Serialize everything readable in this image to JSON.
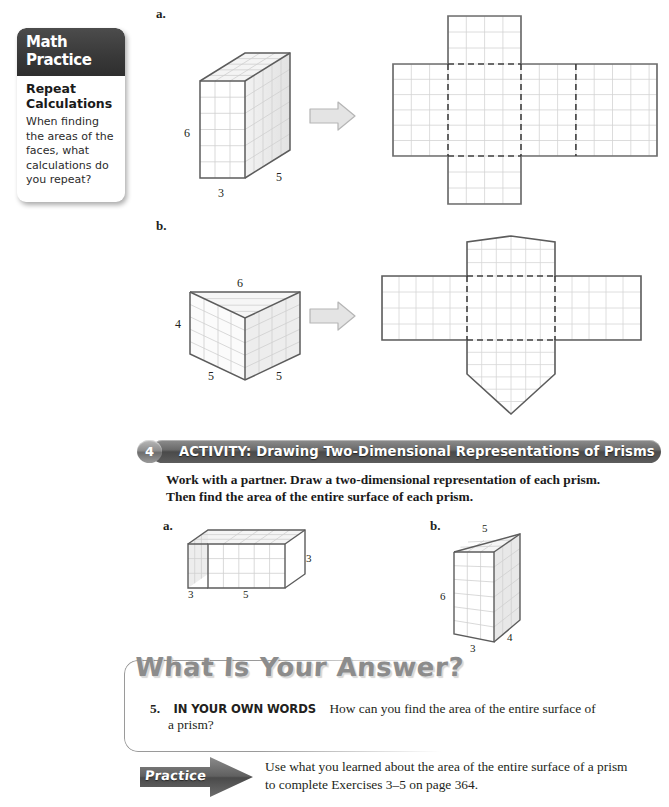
{
  "callout": {
    "header_line1": "Math",
    "header_line2": "Practice",
    "title_line1": "Repeat",
    "title_line2": "Calculations",
    "body": "When finding the areas of the faces, what calculations do you repeat?"
  },
  "top_examples": {
    "a_label": "a.",
    "b_label": "b.",
    "rect_prism": {
      "width_label": "3",
      "depth_label": "5",
      "height_label": "6"
    },
    "tri_prism": {
      "top_label": "6",
      "height_label": "4",
      "left_slant_label": "5",
      "right_slant_label": "5"
    }
  },
  "activity": {
    "number": "4",
    "title": "ACTIVITY:  Drawing Two-Dimensional Representations of Prisms",
    "instructions_line1": "Work with a partner. Draw a two-dimensional representation of each prism.",
    "instructions_line2": "Then find the area of the entire surface of each prism.",
    "a_label": "a.",
    "b_label": "b.",
    "figure_a": {
      "depth_label": "3",
      "width_label": "5",
      "height_label": "3"
    },
    "figure_b": {
      "top_label": "5",
      "height_label": "6",
      "front_label": "3",
      "side_label": "4"
    }
  },
  "answer_section": {
    "heading": "What Is Your Answer?",
    "question_number": "5.",
    "question_caps": "IN YOUR OWN WORDS",
    "question_text": "How can you find the area of the entire surface of",
    "question_text_line2": "a prism?"
  },
  "practice": {
    "label": "Practice",
    "text_line1": "Use what you learned about the area of the entire surface of a prism",
    "text_line2": "to complete Exercises 3–5 on page 364."
  },
  "colors": {
    "ink": "#231f20",
    "grid_line": "#c9c9c9",
    "outline": "#6e6e6e",
    "arrow_fill": "#e2e2e2",
    "banner_dark": "#4a4a4a"
  }
}
